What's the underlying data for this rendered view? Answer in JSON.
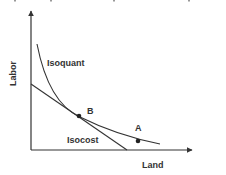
{
  "diagram": {
    "title_cut_off": "",
    "axes": {
      "y_label": "Labor",
      "x_label": "Land"
    },
    "curves": {
      "isoquant_label": "Isoquant",
      "isocost_label": "Isocost"
    },
    "points": [
      {
        "label": "A",
        "description": "point on isoquant, not on isocost"
      },
      {
        "label": "B",
        "description": "tangency point of isoquant and isocost"
      }
    ],
    "colors": {
      "line": "#333333",
      "background": "#ffffff"
    }
  }
}
